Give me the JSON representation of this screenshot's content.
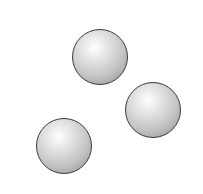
{
  "figure": {
    "background": "#ffffff",
    "spheres": [
      {
        "id": "top",
        "cx": 100,
        "cy": 57,
        "r": 28,
        "fill": "#c4c4c4",
        "stroke": "#3a3a3a"
      },
      {
        "id": "right",
        "cx": 153,
        "cy": 110,
        "r": 28,
        "fill": "#c4c4c4",
        "stroke": "#3a3a3a"
      },
      {
        "id": "bottom-left",
        "cx": 64,
        "cy": 146,
        "r": 28,
        "fill": "#c4c4c4",
        "stroke": "#3a3a3a"
      }
    ]
  }
}
